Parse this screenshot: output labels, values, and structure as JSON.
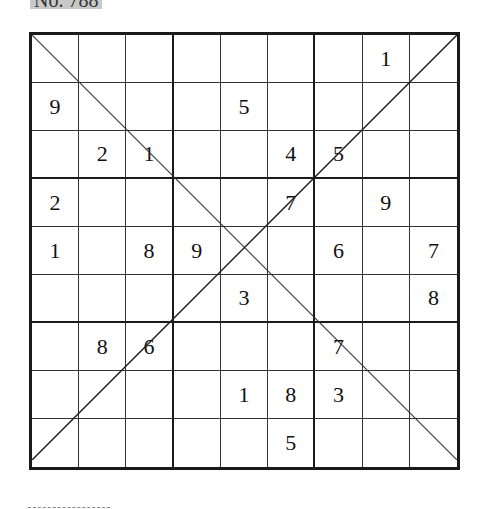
{
  "puzzle": {
    "title": "No. 788",
    "type": "diagonal-sudoku",
    "grid": [
      [
        "",
        "",
        "",
        "",
        "",
        "",
        "",
        "1",
        ""
      ],
      [
        "9",
        "",
        "",
        "",
        "5",
        "",
        "",
        "",
        ""
      ],
      [
        "",
        "2",
        "1",
        "",
        "",
        "4",
        "5",
        "",
        ""
      ],
      [
        "2",
        "",
        "",
        "",
        "",
        "7",
        "",
        "9",
        ""
      ],
      [
        "1",
        "",
        "8",
        "9",
        "",
        "",
        "6",
        "",
        "7"
      ],
      [
        "",
        "",
        "",
        "",
        "3",
        "",
        "",
        "",
        "8"
      ],
      [
        "",
        "8",
        "6",
        "",
        "",
        "",
        "7",
        "",
        ""
      ],
      [
        "",
        "",
        "",
        "",
        "1",
        "8",
        "3",
        "",
        ""
      ],
      [
        "",
        "",
        "",
        "",
        "",
        "5",
        "",
        "",
        ""
      ]
    ],
    "colors": {
      "line": "#1a1a1a",
      "text": "#111111",
      "title_bg": "#c8c8c8"
    }
  }
}
